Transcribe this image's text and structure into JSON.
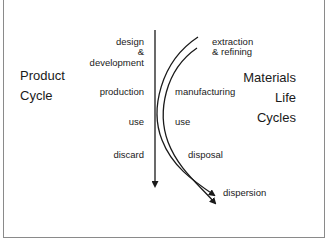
{
  "diagram": {
    "left_title": {
      "line1": "Product",
      "line2": "Cycle"
    },
    "right_title": {
      "line1": "Materials",
      "line2": "Life",
      "line3": "Cycles"
    },
    "product_stages": {
      "design_line1": "design",
      "design_line2": "&",
      "design_line3": "development",
      "production": "production",
      "use": "use",
      "discard": "discard"
    },
    "material_stages": {
      "extraction_line1": "extraction",
      "extraction_line2": "& refining",
      "manufacturing": "manufacturing",
      "use": "use",
      "disposal": "disposal",
      "dispersion": "dispersion"
    },
    "colors": {
      "line": "#1a1a1a",
      "border": "#8a8a8a",
      "background": "#ffffff"
    }
  }
}
